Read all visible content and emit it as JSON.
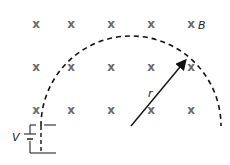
{
  "diagram": {
    "field_symbol": "x",
    "field_label": "B",
    "radius_label": "r",
    "voltage_label": "V",
    "field_grid": {
      "columns": [
        36,
        71,
        111,
        151,
        191
      ],
      "rows": [
        24,
        67,
        110
      ]
    },
    "colors": {
      "field_marks": "#6b6b6b",
      "lines": "#111111"
    }
  }
}
